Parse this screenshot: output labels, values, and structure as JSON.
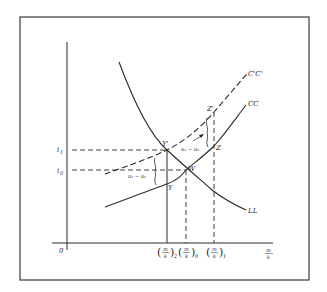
{
  "diagram": {
    "type": "economics-phase-diagram",
    "colors": {
      "ink": "#2a2a2a",
      "frame": "#3a3a3a",
      "background": "#ffffff"
    },
    "axes": {
      "origin_label": "0",
      "x_label_num": "m",
      "x_label_den": "k",
      "y_ticks": [
        {
          "label": "i",
          "sub": "1",
          "y": 150
        },
        {
          "label": "i",
          "sub": "0",
          "y": 170
        }
      ],
      "x_ticks": [
        {
          "num": "m",
          "den": "k",
          "sub": "2",
          "x": 167
        },
        {
          "num": "m",
          "den": "k",
          "sub": "0",
          "x": 186
        },
        {
          "num": "m",
          "den": "k",
          "sub": "1",
          "x": 214
        }
      ]
    },
    "curves": [
      {
        "name": "LL",
        "label": "LL",
        "style": "solid"
      },
      {
        "name": "CC",
        "label": "CC",
        "style": "solid"
      },
      {
        "name": "C'C'",
        "label": "C'C'",
        "style": "dashed"
      }
    ],
    "points": [
      {
        "name": "Y'",
        "label": "Y'",
        "x": 167,
        "y": 150
      },
      {
        "name": "W",
        "label": "W",
        "x": 186,
        "y": 170
      },
      {
        "name": "Y",
        "label": "Y",
        "x": 167,
        "y": 186
      },
      {
        "name": "Z'",
        "label": "Z'",
        "x": 214,
        "y": 112
      },
      {
        "name": "Z",
        "label": "Z",
        "x": 214,
        "y": 146
      }
    ],
    "annotations": [
      {
        "id": "gap-left",
        "text": "π₁ − π₂"
      },
      {
        "id": "gap-right",
        "text": "π₁ − π₂"
      }
    ]
  }
}
